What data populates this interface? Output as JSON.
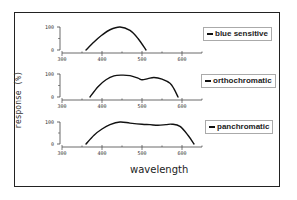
{
  "chart_data": {
    "type": "line",
    "title": "",
    "xlabel": "wavelength",
    "ylabel": "response (%)",
    "xlim": [
      300,
      650
    ],
    "ylim": [
      0,
      100
    ],
    "x_ticks": [
      300,
      400,
      500,
      600
    ],
    "y_ticks": [
      0,
      100
    ],
    "grid": false,
    "legend_position": "right of each panel",
    "panels": [
      {
        "name": "blue sensitive",
        "x": [
          360,
          380,
          400,
          420,
          445,
          470,
          490,
          510
        ],
        "y": [
          0,
          35,
          65,
          88,
          100,
          85,
          50,
          0
        ]
      },
      {
        "name": "orthochromatic",
        "x": [
          370,
          390,
          410,
          430,
          450,
          470,
          490,
          500,
          515,
          530,
          550,
          570,
          580,
          590
        ],
        "y": [
          0,
          45,
          75,
          92,
          95,
          93,
          82,
          75,
          80,
          85,
          78,
          60,
          35,
          0
        ]
      },
      {
        "name": "panchromatic",
        "x": [
          360,
          380,
          400,
          420,
          445,
          470,
          500,
          520,
          540,
          560,
          575,
          595,
          615,
          630
        ],
        "y": [
          0,
          40,
          68,
          88,
          100,
          95,
          90,
          88,
          85,
          88,
          90,
          80,
          40,
          0
        ]
      }
    ]
  },
  "labels": {
    "ylabel": "response (%)",
    "xlabel": "wavelength",
    "legend": [
      "blue sensitive",
      "orthochromatic",
      "panchromatic"
    ],
    "ytick_top": "100",
    "ytick_bottom": "0",
    "xticks": [
      "300",
      "400",
      "500",
      "600"
    ]
  }
}
